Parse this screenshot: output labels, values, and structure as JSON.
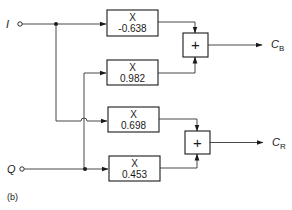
{
  "diagram": {
    "caption": "(b)",
    "inputs": [
      {
        "id": "I",
        "label": "I"
      },
      {
        "id": "Q",
        "label": "Q"
      }
    ],
    "multipliers": [
      {
        "id": "m1",
        "op": "X",
        "coefficient": "-0.638",
        "input": "I",
        "feeds": "sum_B"
      },
      {
        "id": "m2",
        "op": "X",
        "coefficient": "0.982",
        "input": "Q",
        "feeds": "sum_B"
      },
      {
        "id": "m3",
        "op": "X",
        "coefficient": "0.698",
        "input": "I",
        "feeds": "sum_R"
      },
      {
        "id": "m4",
        "op": "X",
        "coefficient": "0.453",
        "input": "Q",
        "feeds": "sum_R"
      }
    ],
    "adders": [
      {
        "id": "sum_B",
        "symbol": "+"
      },
      {
        "id": "sum_R",
        "symbol": "+"
      }
    ],
    "outputs": [
      {
        "id": "CB",
        "label": "C",
        "subscript": "B"
      },
      {
        "id": "CR",
        "label": "C",
        "subscript": "R"
      }
    ]
  }
}
